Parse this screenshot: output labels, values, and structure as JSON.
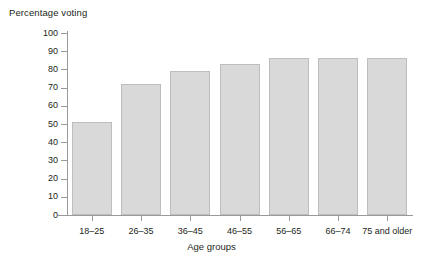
{
  "chart_data": {
    "type": "bar",
    "title": "",
    "ylabel": "Percentage voting",
    "xlabel": "Age groups",
    "categories": [
      "18–25",
      "26–35",
      "36–45",
      "46–55",
      "56–65",
      "66–74",
      "75 and older"
    ],
    "values": [
      51,
      72,
      79,
      83,
      86,
      86,
      86
    ],
    "ylim": [
      0,
      100
    ],
    "ytick_labels": [
      "100",
      "90",
      "80",
      "70",
      "60",
      "50",
      "40",
      "30",
      "20",
      "10",
      "0"
    ],
    "ytick_values": [
      100,
      90,
      80,
      70,
      60,
      50,
      40,
      30,
      20,
      10,
      0
    ],
    "grid": false,
    "legend": null,
    "series": [
      {
        "name": "Percentage voting",
        "values": [
          51,
          72,
          79,
          83,
          86,
          86,
          86
        ]
      }
    ],
    "colors": {
      "bar_fill": "#d9d9d9",
      "bar_border": "#bdbdbd",
      "axis": "#9a9a9a",
      "text": "#231f20",
      "background": "#ffffff"
    }
  }
}
